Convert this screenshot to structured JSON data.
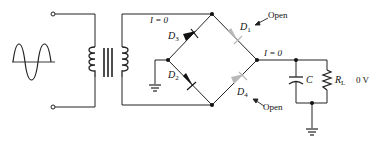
{
  "diagram": {
    "labels": {
      "current_top": "I = 0",
      "current_output": "I = 0",
      "d1": "D",
      "d1_sub": "1",
      "d2": "D",
      "d2_sub": "2",
      "d3": "D",
      "d3_sub": "3",
      "d4": "D",
      "d4_sub": "4",
      "d1_status": "Open",
      "d4_status": "Open",
      "capacitor": "C",
      "load": "R",
      "load_sub": "L",
      "output_voltage": "0 V"
    },
    "components": [
      {
        "id": "source",
        "type": "ac-sine-source"
      },
      {
        "id": "T1",
        "type": "iron-core-transformer"
      },
      {
        "id": "D1",
        "type": "diode",
        "state": "open"
      },
      {
        "id": "D2",
        "type": "diode",
        "state": "conducting"
      },
      {
        "id": "D3",
        "type": "diode",
        "state": "conducting"
      },
      {
        "id": "D4",
        "type": "diode",
        "state": "open"
      },
      {
        "id": "C",
        "type": "capacitor"
      },
      {
        "id": "RL",
        "type": "resistor"
      },
      {
        "id": "GND1",
        "type": "ground"
      },
      {
        "id": "GND2",
        "type": "ground"
      }
    ],
    "colors": {
      "wire": "#222222",
      "open_diode": "#b8b8b8",
      "background": "#ffffff"
    }
  }
}
